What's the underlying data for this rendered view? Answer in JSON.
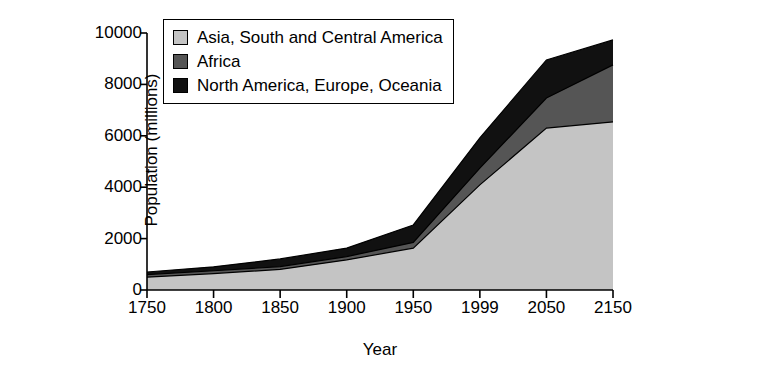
{
  "chart_data": {
    "type": "area",
    "stacked": true,
    "title": "",
    "xlabel": "Year",
    "ylabel": "Population (millions)",
    "categories": [
      "1750",
      "1800",
      "1850",
      "1900",
      "1950",
      "1999",
      "2050",
      "2150"
    ],
    "ylim": [
      0,
      10000
    ],
    "yticks": [
      "0",
      "2000",
      "4000",
      "6000",
      "8000",
      "10000"
    ],
    "ytick_values": [
      0,
      2000,
      4000,
      6000,
      8000,
      10000
    ],
    "grid": false,
    "legend_position": "top-left-inside",
    "series": [
      {
        "name": "Asia, South and Central America",
        "color": "#c4c4c4",
        "values": [
          500,
          640,
          800,
          1170,
          1630,
          4090,
          6300,
          6540
        ]
      },
      {
        "name": "Africa",
        "color": "#555555",
        "values": [
          100,
          110,
          110,
          130,
          220,
          650,
          1170,
          2220
        ]
      },
      {
        "name": "North America, Europe, Oceania",
        "color": "#111111",
        "values": [
          100,
          150,
          300,
          330,
          680,
          1180,
          1480,
          970
        ]
      }
    ],
    "totals": [
      700,
      900,
      1210,
      1630,
      2530,
      5920,
      8950,
      9730
    ]
  },
  "legend": {
    "items": [
      {
        "label": "Asia, South and Central America",
        "color": "#c4c4c4"
      },
      {
        "label": "Africa",
        "color": "#555555"
      },
      {
        "label": "North America, Europe, Oceania",
        "color": "#111111"
      }
    ]
  },
  "axes": {
    "y_title": "Population (millions)",
    "x_title": "Year",
    "y_ticks": [
      "10000",
      "8000",
      "6000",
      "4000",
      "2000",
      "0"
    ],
    "x_ticks": [
      "1750",
      "1800",
      "1850",
      "1900",
      "1950",
      "1999",
      "2050",
      "2150"
    ]
  }
}
